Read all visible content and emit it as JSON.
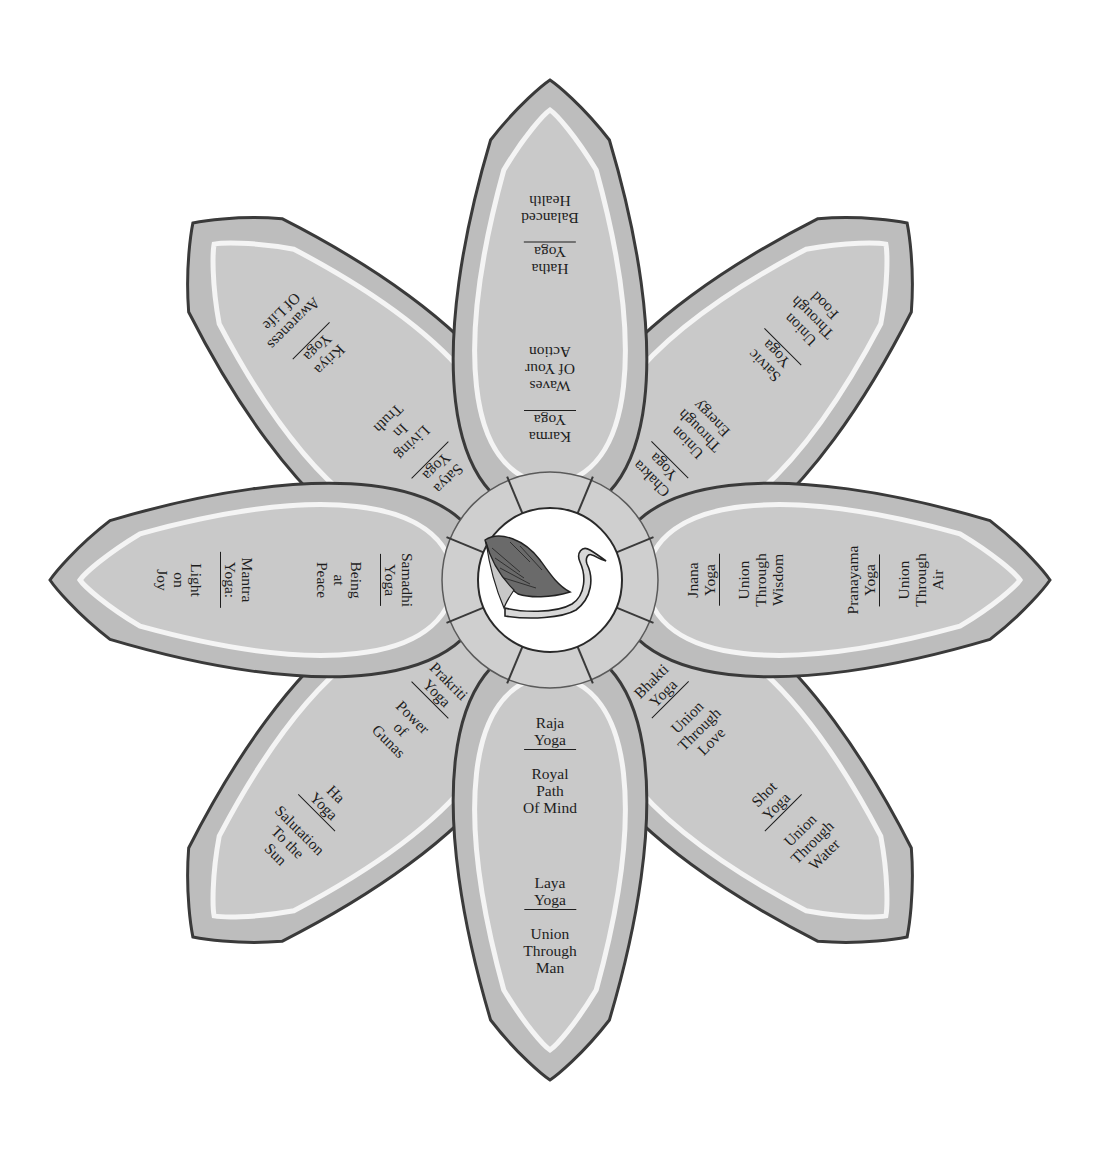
{
  "diagram": {
    "type": "lotus",
    "center": {
      "icon": "swan-icon"
    },
    "colors": {
      "petal_fill": "#bdbdbd",
      "petal_inner": "#c9c9c9",
      "petal_highlight": "#f4f4f4",
      "outline": "#3a3a3a",
      "text": "#1d1d1d",
      "center_fill": "#ffffff"
    },
    "petals": [
      {
        "direction": "up",
        "inner": {
          "name": "Karma",
          "suffix": "Yoga",
          "lines": [
            "Waves",
            "Of Your",
            "Action"
          ]
        },
        "outer": {
          "name": "Hatha",
          "suffix": "Yoga",
          "lines": [
            "Balanced",
            "Health"
          ]
        }
      },
      {
        "direction": "up-right",
        "inner": {
          "name": "Chakra",
          "suffix": "Yoga",
          "lines": [
            "Union",
            "Through",
            "Energy"
          ]
        },
        "outer": {
          "name": "Satvic",
          "suffix": "Yoga",
          "lines": [
            "Union",
            "Through",
            "Food"
          ]
        }
      },
      {
        "direction": "right",
        "inner": {
          "name": "Jnana",
          "suffix": "Yoga",
          "lines": [
            "Union",
            "Through",
            "Wisdom"
          ]
        },
        "outer": {
          "name": "Pranayama",
          "suffix": "Yoga",
          "lines": [
            "Union",
            "Through",
            "Air"
          ]
        }
      },
      {
        "direction": "down-right",
        "inner": {
          "name": "Bhakti",
          "suffix": "Yoga",
          "lines": [
            "Union",
            "Through",
            "Love"
          ]
        },
        "outer": {
          "name": "Shot",
          "suffix": "Yoga",
          "lines": [
            "Union",
            "Through",
            "Water"
          ]
        }
      },
      {
        "direction": "down",
        "inner": {
          "name": "Raja",
          "suffix": "Yoga",
          "lines": [
            "Royal",
            "Path",
            "Of Mind"
          ]
        },
        "outer": {
          "name": "Laya",
          "suffix": "Yoga",
          "lines": [
            "Union",
            "Through",
            "Man"
          ]
        }
      },
      {
        "direction": "down-left",
        "inner": {
          "name": "Prakriti",
          "suffix": "Yoga",
          "lines": [
            "Power",
            "of",
            "Gunas"
          ]
        },
        "outer": {
          "name": "Ha",
          "suffix": "Yoga",
          "lines": [
            "Salutation",
            "To the",
            "Sun"
          ]
        }
      },
      {
        "direction": "left",
        "inner": {
          "name": "Samadhi",
          "suffix": "Yoga",
          "lines": [
            "Being",
            "at",
            "Peace"
          ]
        },
        "outer": {
          "name": "Mantra",
          "suffix": "Yoga:",
          "lines": [
            "Light",
            "on",
            "Joy"
          ]
        }
      },
      {
        "direction": "up-left",
        "inner": {
          "name": "Satya",
          "suffix": "Yoga",
          "lines": [
            "Living",
            "In",
            "Truth"
          ]
        },
        "outer": {
          "name": "Kriya",
          "suffix": "Yoga",
          "lines": [
            "Awareness",
            "Of Life"
          ]
        }
      }
    ]
  }
}
